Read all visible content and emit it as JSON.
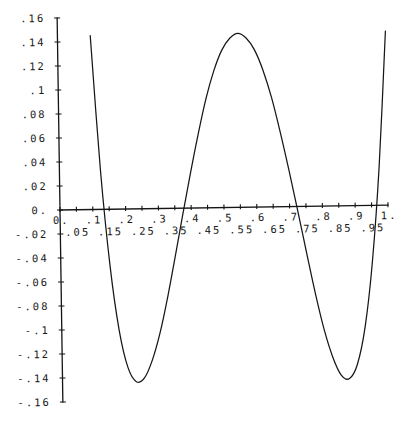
{
  "chart_data": {
    "type": "line",
    "title": "",
    "xlabel": "",
    "ylabel": "",
    "xlim": [
      0,
      1
    ],
    "ylim": [
      -0.16,
      0.16
    ],
    "grid": false,
    "legend": "none",
    "x_ticks": [
      0,
      0.05,
      0.1,
      0.15,
      0.2,
      0.25,
      0.3,
      0.35,
      0.4,
      0.45,
      0.5,
      0.55,
      0.6,
      0.65,
      0.7,
      0.75,
      0.8,
      0.85,
      0.9,
      0.95,
      1.0
    ],
    "x_tick_labels": [
      "0.",
      ".05",
      ".1",
      ".15",
      ".2",
      ".25",
      ".3",
      ".35",
      ".4",
      ".45",
      ".5",
      ".55",
      ".6",
      ".65",
      ".7",
      ".75",
      ".8",
      ".85",
      ".9",
      ".95",
      "1."
    ],
    "y_ticks": [
      0.16,
      0.14,
      0.12,
      0.1,
      0.08,
      0.06,
      0.04,
      0.02,
      0,
      -0.02,
      -0.04,
      -0.06,
      -0.08,
      -0.1,
      -0.12,
      -0.14,
      -0.16
    ],
    "y_tick_labels": [
      ".16",
      ".14",
      ".12",
      ".1",
      ".08",
      ".06",
      ".04",
      ".02",
      "0.",
      "-.02",
      "-.04",
      "-.06",
      "-.08",
      "-.1",
      "-.12",
      "-.14",
      "-.16"
    ],
    "series": [
      {
        "name": "curve",
        "color": "#161616",
        "x": [
          0.1,
          0.125,
          0.15,
          0.175,
          0.2,
          0.225,
          0.25,
          0.275,
          0.3,
          0.325,
          0.35,
          0.375,
          0.4,
          0.425,
          0.45,
          0.475,
          0.5,
          0.525,
          0.55,
          0.575,
          0.6,
          0.625,
          0.65,
          0.675,
          0.7,
          0.725,
          0.75,
          0.775,
          0.8,
          0.825,
          0.85,
          0.875,
          0.9,
          0.925,
          0.95,
          0.975,
          1.0
        ],
        "y": [
          0.145,
          0.033,
          -0.047,
          -0.101,
          -0.132,
          -0.144,
          -0.141,
          -0.126,
          -0.103,
          -0.073,
          -0.039,
          -0.004,
          0.03,
          0.062,
          0.091,
          0.114,
          0.131,
          0.141,
          0.145,
          0.141,
          0.131,
          0.114,
          0.091,
          0.062,
          0.03,
          -0.004,
          -0.039,
          -0.073,
          -0.103,
          -0.126,
          -0.141,
          -0.144,
          -0.132,
          -0.101,
          -0.047,
          0.033,
          0.145
        ]
      }
    ]
  }
}
